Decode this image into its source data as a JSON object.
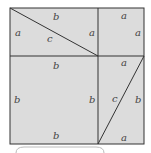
{
  "diagram": {
    "fill_color": "#dcdcdc",
    "line_color": "#333333",
    "labels": {
      "top_left_top": "b",
      "top_left_left": "a",
      "top_left_right": "a",
      "top_left_hyp": "c",
      "top_right_top": "a",
      "top_right_right": "a",
      "bottom_left_top": "b",
      "bottom_left_left": "b",
      "bottom_left_right": "b",
      "bottom_left_bottom": "b",
      "bottom_right_top": "a",
      "bottom_right_hyp": "c",
      "bottom_right_right": "b",
      "bottom_right_bottom": "a"
    }
  }
}
